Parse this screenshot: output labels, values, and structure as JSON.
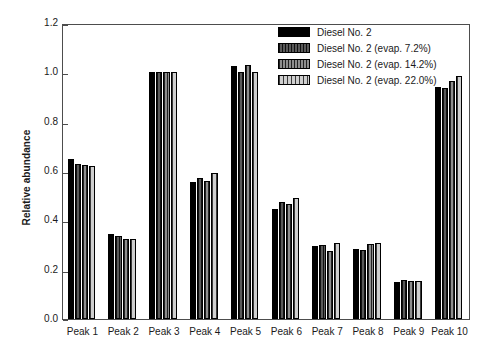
{
  "chart_data": {
    "type": "bar",
    "title": "",
    "xlabel": "",
    "ylabel": "Relative abundance",
    "ylim": [
      0.0,
      1.2
    ],
    "yticks": [
      "0.0",
      "0.2",
      "0.4",
      "0.6",
      "0.8",
      "1.0",
      "1.2"
    ],
    "grid": false,
    "legend_position": "top-right",
    "categories": [
      "Peak 1",
      "Peak 2",
      "Peak 3",
      "Peak 4",
      "Peak 5",
      "Peak 6",
      "Peak 7",
      "Peak 8",
      "Peak 9",
      "Peak 10"
    ],
    "series": [
      {
        "name": "Diesel No. 2",
        "pattern": "solid-black",
        "color": "#000000",
        "values": [
          0.65,
          0.345,
          1.0,
          0.555,
          1.025,
          0.445,
          0.295,
          0.285,
          0.15,
          0.94
        ]
      },
      {
        "name": "Diesel No. 2 (evap. 7.2%)",
        "pattern": "dark-vertical-lines",
        "color": "#3d3d3d",
        "values": [
          0.627,
          0.335,
          1.0,
          0.57,
          1.0,
          0.475,
          0.3,
          0.28,
          0.16,
          0.935
        ]
      },
      {
        "name": "Diesel No. 2 (evap. 14.2%)",
        "pattern": "medium-crosshatch",
        "color": "#8e8e8e",
        "values": [
          0.625,
          0.325,
          1.0,
          0.56,
          1.03,
          0.465,
          0.275,
          0.305,
          0.155,
          0.965
        ]
      },
      {
        "name": "Diesel No. 2 (evap. 22.0%)",
        "pattern": "light-grid",
        "color": "#cfcfcf",
        "values": [
          0.622,
          0.325,
          1.0,
          0.59,
          1.0,
          0.49,
          0.31,
          0.31,
          0.155,
          0.985
        ]
      }
    ]
  }
}
